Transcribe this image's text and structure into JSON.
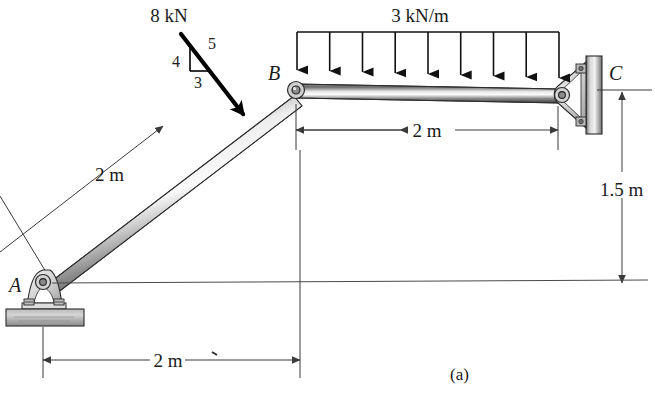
{
  "figure": {
    "caption": "(a)",
    "title_implied": "Pin-connected frame ABC with applied loads",
    "points": {
      "a": "A",
      "b": "B",
      "c": "C"
    },
    "loads": {
      "point_force": {
        "magnitude": "8 kN",
        "slope_vertical": "4",
        "slope_horizontal": "3",
        "slope_hypotenuse": "5"
      },
      "distributed": {
        "magnitude": "3 kN/m",
        "arrow_count": 9,
        "span_label": "2 m"
      }
    },
    "dimensions": {
      "incline_length": "2 m",
      "beam_span": "2 m",
      "base_span": "2 m",
      "height": "1.5 m"
    },
    "colors": {
      "member_light": "#d9d9d9",
      "member_dark": "#4a4a4a",
      "member_mid": "#9a9a9a",
      "ink": "#1a1a1a",
      "dim_ink": "#3a3a3a",
      "background": "#ffffff"
    },
    "icons": {
      "pin_a": "pin-support-icon",
      "pin_b": "pin-joint-icon",
      "pin_c": "wall-bracket-icon",
      "arrow": "down-arrow-icon"
    }
  }
}
